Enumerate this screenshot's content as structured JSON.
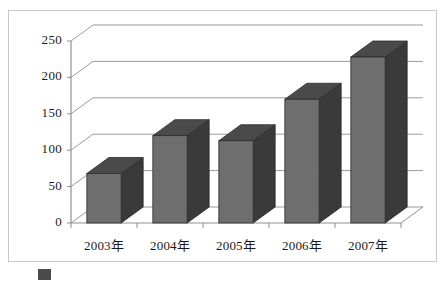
{
  "chart_data": {
    "type": "bar",
    "title": "",
    "subtitle": "",
    "xlabel": "",
    "ylabel": "",
    "categories": [
      "2003年",
      "2004年",
      "2005年",
      "2006年",
      "2007年"
    ],
    "values": [
      68,
      120,
      113,
      170,
      228
    ],
    "series": [
      {
        "name": "",
        "values": [
          68,
          120,
          113,
          170,
          228
        ]
      }
    ],
    "ylim": [
      0,
      250
    ],
    "yticks": [
      0,
      50,
      100,
      150,
      200,
      250
    ],
    "ytick_labels": [
      "0",
      "50",
      "100",
      "150",
      "200",
      "250"
    ],
    "grid": true,
    "grid_axis": "y",
    "legend": false,
    "legend_position": "none",
    "projection": "3d-column",
    "annotations": [],
    "colors": {
      "bar_front": "#6e6e6e",
      "bar_side": "#3a3a3a",
      "bar_top": "#4a4a4a",
      "bar_outline": "#2b2b2b",
      "gridline": "#9a9a9a",
      "axis": "#8f8f8f",
      "frame_border": "#c8c8c8",
      "plot_background": "#ffffff",
      "text": "#1a1a1a"
    }
  },
  "caption": {
    "marker": "■",
    "text": ""
  }
}
